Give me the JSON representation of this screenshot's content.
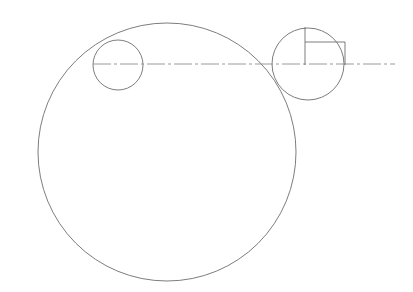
{
  "document": {
    "title": "Technical line drawing — tangent circles with rectangular detail",
    "background_color": "#ffffff",
    "width": 413,
    "height": 292
  },
  "style": {
    "outline_color": "#6e6e6e",
    "detail_color": "#6e6e6e",
    "centerline_color": "#8f8f8f",
    "outline_width": 0.9,
    "detail_width": 0.9,
    "centerline_width": 0.9,
    "centerline_dash": "18,3,3,3"
  },
  "chart_data": {
    "type": "diagram",
    "units": "pixels",
    "xlim": [
      0,
      413
    ],
    "ylim": [
      0,
      292
    ],
    "grid": false,
    "legend": false,
    "shapes": [
      {
        "name": "large-circle",
        "kind": "circle",
        "cx": 167,
        "cy": 152,
        "r": 129,
        "stroke": "#6e6e6e",
        "stroke_width": 0.9,
        "fill": "none"
      },
      {
        "name": "left-small-circle",
        "kind": "circle",
        "cx": 118,
        "cy": 65,
        "r": 25,
        "stroke": "#6e6e6e",
        "stroke_width": 0.9,
        "fill": "none"
      },
      {
        "name": "right-small-circle",
        "kind": "circle",
        "cx": 308,
        "cy": 64,
        "r": 36,
        "stroke": "#6e6e6e",
        "stroke_width": 0.9,
        "fill": "none"
      },
      {
        "name": "horizontal-centerline",
        "kind": "line",
        "x1": 93,
        "y1": 64,
        "x2": 395,
        "y2": 64,
        "stroke": "#8f8f8f",
        "stroke_width": 0.9,
        "dash": "18,3,3,3"
      },
      {
        "name": "detail-vertical-left-edge",
        "kind": "line",
        "x1": 305,
        "y1": 27,
        "x2": 305,
        "y2": 65,
        "stroke": "#6e6e6e",
        "stroke_width": 0.9
      },
      {
        "name": "detail-rectangle-top-edge",
        "kind": "line",
        "x1": 305,
        "y1": 42,
        "x2": 345,
        "y2": 42,
        "stroke": "#6e6e6e",
        "stroke_width": 0.9
      },
      {
        "name": "detail-rectangle-right-edge",
        "kind": "line",
        "x1": 345,
        "y1": 42,
        "x2": 345,
        "y2": 65,
        "stroke": "#6e6e6e",
        "stroke_width": 0.9
      }
    ]
  }
}
